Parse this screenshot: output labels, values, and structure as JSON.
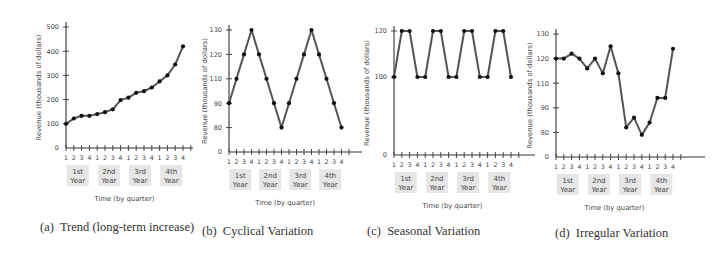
{
  "chart_data": [
    {
      "id": "a",
      "type": "line",
      "caption_letter": "(a)",
      "caption_text": "Trend (long-term increase)",
      "title": "Trend (long-term increase)",
      "xlabel": "Time (by quarter)",
      "ylabel": "Revenue (thousands of dollars)",
      "quarter_ticks": [
        "1",
        "2",
        "3",
        "4",
        "1",
        "2",
        "3",
        "4",
        "1",
        "2",
        "3",
        "4",
        "1",
        "2",
        "3",
        "4"
      ],
      "year_labels": [
        [
          "1st",
          "Year"
        ],
        [
          "2nd",
          "Year"
        ],
        [
          "3rd",
          "Year"
        ],
        [
          "4th",
          "Year"
        ]
      ],
      "y_ticks": [
        "0",
        "100",
        "200",
        "300",
        "400",
        "500"
      ],
      "y_tick_values": [
        0,
        100,
        200,
        300,
        400,
        500
      ],
      "ylim": [
        0,
        500
      ],
      "values": [
        100,
        122,
        133,
        133,
        140,
        148,
        160,
        198,
        208,
        228,
        235,
        250,
        275,
        300,
        345,
        420
      ],
      "grid": false
    },
    {
      "id": "b",
      "type": "line",
      "caption_letter": "(b)",
      "caption_text": "Cyclical Variation",
      "title": "Cyclical Variation",
      "xlabel": "Time (by quarter)",
      "ylabel": "Revenue (thousands of dollars)",
      "quarter_ticks": [
        "1",
        "2",
        "3",
        "4",
        "1",
        "2",
        "3",
        "4",
        "1",
        "2",
        "3",
        "4",
        "1",
        "2",
        "3",
        "4"
      ],
      "year_labels": [
        [
          "1st",
          "Year"
        ],
        [
          "2nd",
          "Year"
        ],
        [
          "3rd",
          "Year"
        ],
        [
          "4th",
          "Year"
        ]
      ],
      "y_ticks": [
        "0",
        "80",
        "90",
        "110",
        "120",
        "130"
      ],
      "y_tick_values": [
        0,
        80,
        90,
        110,
        120,
        130
      ],
      "values": [
        90,
        110,
        120,
        130,
        120,
        110,
        90,
        80,
        90,
        110,
        120,
        130,
        120,
        110,
        90,
        80
      ],
      "grid": false
    },
    {
      "id": "c",
      "type": "line",
      "caption_letter": "(c)",
      "caption_text": "Seasonal Variation",
      "title": "Seasonal Variation",
      "xlabel": "Time (by quarter)",
      "ylabel": "Revenue (thousands of dollars)",
      "quarter_ticks": [
        "1",
        "2",
        "3",
        "4",
        "1",
        "2",
        "3",
        "4",
        "1",
        "2",
        "3",
        "4",
        "1",
        "2",
        "3",
        "4"
      ],
      "year_labels": [
        [
          "1st",
          "Year"
        ],
        [
          "2nd",
          "Year"
        ],
        [
          "3rd",
          "Year"
        ],
        [
          "4th",
          "Year"
        ]
      ],
      "y_ticks": [
        "0",
        "100",
        "120"
      ],
      "y_tick_values": [
        0,
        100,
        120
      ],
      "values": [
        100,
        120,
        120,
        100,
        100,
        120,
        120,
        100,
        100,
        120,
        120,
        100,
        100,
        120,
        120,
        100
      ],
      "grid": false
    },
    {
      "id": "d",
      "type": "line",
      "caption_letter": "(d)",
      "caption_text": "Irregular Variation",
      "title": "Irregular Variation",
      "xlabel": "Time (by quarter)",
      "ylabel": "Revenue (thousands of dollars)",
      "quarter_ticks": [
        "1",
        "2",
        "3",
        "4",
        "1",
        "2",
        "3",
        "4",
        "1",
        "2",
        "3",
        "4",
        "1",
        "2",
        "3",
        "4"
      ],
      "year_labels": [
        [
          "1st",
          "Year"
        ],
        [
          "2nd",
          "Year"
        ],
        [
          "3rd",
          "Year"
        ],
        [
          "4th",
          "Year"
        ]
      ],
      "y_ticks": [
        "0",
        "80",
        "90",
        "110",
        "120",
        "130"
      ],
      "y_tick_values": [
        0,
        80,
        90,
        110,
        120,
        130
      ],
      "values": [
        120,
        120,
        122,
        120,
        116,
        120,
        114,
        125,
        114,
        82,
        86,
        72,
        84,
        98,
        98,
        124
      ],
      "grid": false
    }
  ]
}
